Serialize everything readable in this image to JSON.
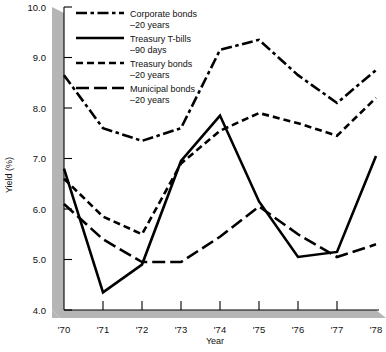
{
  "chart_data": {
    "type": "line",
    "title": "",
    "xlabel": "Year",
    "ylabel": "Yield (%)",
    "x": [
      "'70",
      "'71",
      "'72",
      "'73",
      "'74",
      "'75",
      "'76",
      "'77",
      "'78"
    ],
    "x_tick_labels": [
      "'70",
      "'71",
      "'72",
      "'73",
      "'74",
      "'75",
      "'76",
      "'77",
      "'78"
    ],
    "y_tick_labels": [
      "4.0",
      "5.0",
      "6.0",
      "7.0",
      "8.0",
      "9.0",
      "10.0"
    ],
    "y_ticks": [
      4.0,
      5.0,
      6.0,
      7.0,
      8.0,
      9.0,
      10.0
    ],
    "ylim": [
      4.0,
      10.0
    ],
    "xlim": [
      "'70",
      "'78"
    ],
    "grid": false,
    "legend_position": "top-center",
    "series": [
      {
        "name": "Corporate bonds",
        "sublabel": "–20 years",
        "dash": "dash-dot",
        "values": [
          8.65,
          7.6,
          7.35,
          7.6,
          9.15,
          9.35,
          8.65,
          8.1,
          8.75
        ]
      },
      {
        "name": "Treasury T-bills",
        "sublabel": "–90 days",
        "dash": "solid",
        "values": [
          6.8,
          4.35,
          4.9,
          6.95,
          7.85,
          6.15,
          5.05,
          5.15,
          7.05
        ]
      },
      {
        "name": "Treasury bonds",
        "sublabel": "–20 years",
        "dash": "short-dash",
        "values": [
          6.6,
          5.85,
          5.5,
          6.9,
          7.55,
          7.9,
          7.7,
          7.45,
          8.2
        ]
      },
      {
        "name": "Municipal bonds",
        "sublabel": "–20 years",
        "dash": "long-dash",
        "values": [
          6.1,
          5.4,
          4.95,
          4.95,
          5.45,
          6.05,
          5.5,
          5.05,
          5.3
        ]
      }
    ],
    "colors": {
      "line": "#000000",
      "axis": "#000000",
      "shadow": "#b5b5b5",
      "background": "#ffffff"
    }
  }
}
